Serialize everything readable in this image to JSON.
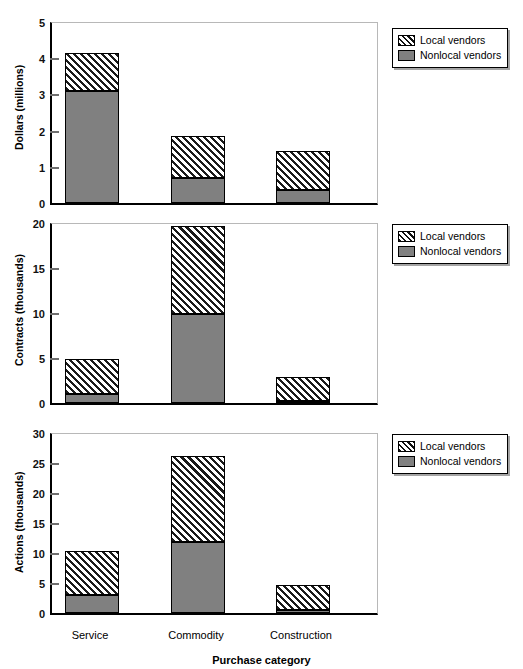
{
  "chart_data": [
    {
      "type": "bar",
      "title": "",
      "xlabel": "Purchase category",
      "ylabel": "Dollars (millions)",
      "categories": [
        "Service",
        "Commodity",
        "Construction"
      ],
      "ylim": [
        0,
        5
      ],
      "yticks": [
        0,
        1,
        2,
        3,
        4,
        5
      ],
      "ytick_labels": [
        "0",
        "1",
        "2",
        "3",
        "4",
        "5"
      ],
      "grid": false,
      "stacked": true,
      "legend_position": "right",
      "series": [
        {
          "name": "Nonlocal vendors",
          "values": [
            3.1,
            0.7,
            0.35
          ],
          "fill": "solid-gray",
          "color": "#808080"
        },
        {
          "name": "Local vendors",
          "values": [
            1.05,
            1.15,
            1.1
          ],
          "fill": "diagonal-hatch",
          "color": "#ffffff"
        }
      ],
      "totals": [
        4.15,
        1.85,
        1.45
      ]
    },
    {
      "type": "bar",
      "title": "",
      "xlabel": "Purchase category",
      "ylabel": "Contracts (thousands)",
      "categories": [
        "Service",
        "Commodity",
        "Construction"
      ],
      "ylim": [
        0,
        20
      ],
      "yticks": [
        0,
        5,
        10,
        15,
        20
      ],
      "ytick_labels": [
        "0",
        "5",
        "10",
        "15",
        "20"
      ],
      "grid": false,
      "stacked": true,
      "legend_position": "right",
      "series": [
        {
          "name": "Nonlocal vendors",
          "values": [
            1.0,
            9.9,
            0.2
          ],
          "fill": "solid-gray",
          "color": "#808080"
        },
        {
          "name": "Local vendors",
          "values": [
            3.9,
            9.8,
            2.7
          ],
          "fill": "diagonal-hatch",
          "color": "#ffffff"
        }
      ],
      "totals": [
        4.9,
        19.7,
        2.9
      ]
    },
    {
      "type": "bar",
      "title": "",
      "xlabel": "Purchase category",
      "ylabel": "Actions (thousands)",
      "categories": [
        "Service",
        "Commodity",
        "Construction"
      ],
      "ylim": [
        0,
        30
      ],
      "yticks": [
        0,
        5,
        10,
        15,
        20,
        25,
        30
      ],
      "ytick_labels": [
        "0",
        "5",
        "10",
        "15",
        "20",
        "25",
        "30"
      ],
      "grid": false,
      "stacked": true,
      "legend_position": "right",
      "series": [
        {
          "name": "Nonlocal vendors",
          "values": [
            3.0,
            11.9,
            0.5
          ],
          "fill": "solid-gray",
          "color": "#808080"
        },
        {
          "name": "Local vendors",
          "values": [
            7.3,
            14.2,
            4.2
          ],
          "fill": "diagonal-hatch",
          "color": "#ffffff"
        }
      ],
      "totals": [
        10.3,
        26.1,
        4.7
      ]
    }
  ],
  "legend": {
    "entries": [
      {
        "label": "Local vendors",
        "swatch": "diagonal-hatch"
      },
      {
        "label": "Nonlocal vendors",
        "swatch": "solid-gray"
      }
    ]
  },
  "axis": {
    "x_title": "Purchase category",
    "categories": [
      "Service",
      "Commodity",
      "Construction"
    ]
  },
  "colors": {
    "nonlocal": "#808080",
    "hatch_line": "#1a1a1a",
    "background": "#ffffff",
    "frame": "#000000"
  }
}
